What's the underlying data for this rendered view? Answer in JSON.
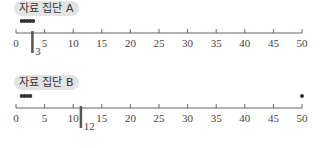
{
  "chart_data": [
    {
      "type": "dot",
      "title": "자료 집단 A",
      "xlim": [
        0,
        50
      ],
      "ticks": [
        0,
        5,
        10,
        15,
        20,
        25,
        30,
        35,
        40,
        45,
        50
      ],
      "points": [
        1,
        1.5,
        2,
        2.5,
        3
      ],
      "median_marker": {
        "value": 3,
        "label": "3"
      },
      "grid": false
    },
    {
      "type": "dot",
      "title": "자료 집단 B",
      "xlim": [
        0,
        50
      ],
      "ticks": [
        0,
        5,
        10,
        15,
        20,
        25,
        30,
        35,
        40,
        45,
        50
      ],
      "points": [
        1,
        1.5,
        2,
        2.5,
        50
      ],
      "median_marker": {
        "value": 12,
        "label": "12"
      },
      "grid": false
    }
  ],
  "panels": [
    {
      "title": "자료 집단 A"
    },
    {
      "title": "자료 집단 B"
    }
  ],
  "colors": {
    "axis": "#666666",
    "dot": "#333333",
    "marker": "#555555",
    "label_bg": "#e3e3e3"
  }
}
